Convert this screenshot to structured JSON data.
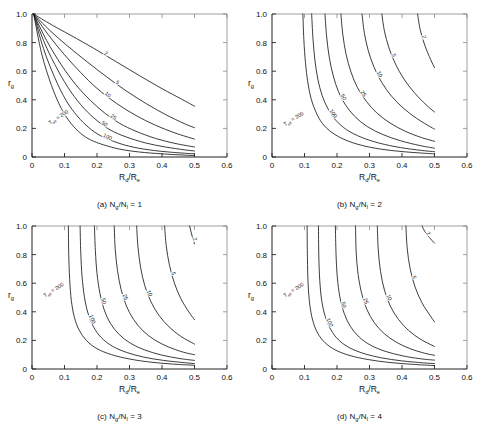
{
  "figure": {
    "panels": [
      {
        "id": "a",
        "caption_prefix": "(a)",
        "caption_num": "N",
        "caption_sub1": "g",
        "caption_slash": "/N",
        "caption_sub2": "l",
        "caption_eq": " = 1",
        "caption_full": "(a) Ng/Nl = 1"
      },
      {
        "id": "b",
        "caption_prefix": "(b)",
        "caption_num": "N",
        "caption_sub1": "g",
        "caption_slash": "/N",
        "caption_sub2": "l",
        "caption_eq": " = 2",
        "caption_full": "(b) Ng/Nl = 2"
      },
      {
        "id": "c",
        "caption_prefix": "(c)",
        "caption_num": "N",
        "caption_sub1": "g",
        "caption_slash": "/N",
        "caption_sub2": "l",
        "caption_eq": " = 3",
        "caption_full": "(c) Ng/Nl = 3"
      },
      {
        "id": "d",
        "caption_prefix": "(d)",
        "caption_num": "N",
        "caption_sub1": "g",
        "caption_slash": "/N",
        "caption_sub2": "l",
        "caption_eq": " = 4",
        "caption_full": "(d) Ng/Nl = 4"
      }
    ],
    "axis": {
      "x_title_main": "R",
      "x_title_sub1": "d",
      "x_title_mid": "/R",
      "x_title_sub2": "e",
      "x_title_full": "Rd/Re",
      "y_title_main": "r",
      "y_title_sub": "g",
      "y_title_full": "rg",
      "x_ticks": [
        "0",
        "0.1",
        "0.2",
        "0.3",
        "0.4",
        "0.5",
        "0.6"
      ],
      "y_ticks": [
        "0",
        "0.2",
        "0.4",
        "0.6",
        "0.8",
        "1.0"
      ]
    },
    "teff_label": {
      "main": "T",
      "sub": "eff",
      "eq": " = 200",
      "full": "Teff = 200"
    },
    "curve_labels": [
      "200",
      "100",
      "50",
      "25",
      "10",
      "5",
      "2"
    ]
  },
  "chart_data": {
    "type": "line",
    "title": "",
    "xlabel": "Rd/Re",
    "ylabel": "rg",
    "xlim": [
      0,
      0.6
    ],
    "ylim": [
      0,
      1.0
    ],
    "xticks": [
      0,
      0.1,
      0.2,
      0.3,
      0.4,
      0.5,
      0.6
    ],
    "yticks": [
      0,
      0.2,
      0.4,
      0.6,
      0.8,
      1.0
    ],
    "grid": false,
    "legend": "inline-curve-labels",
    "panel_count": 4,
    "parameter_name": "Teff",
    "parameter_values": [
      200,
      100,
      50,
      25,
      10,
      5,
      2
    ],
    "panels": [
      {
        "id": "a",
        "label": "(a) Ng/Nl = 1",
        "series": [
          {
            "name": "200",
            "x": [
              0.005,
              0.03,
              0.06,
              0.09,
              0.12,
              0.15,
              0.18,
              0.22,
              0.27,
              0.33,
              0.4,
              0.47,
              0.5
            ],
            "y": [
              1.0,
              0.72,
              0.5,
              0.34,
              0.235,
              0.165,
              0.12,
              0.085,
              0.055,
              0.035,
              0.022,
              0.013,
              0.01
            ]
          },
          {
            "name": "100",
            "x": [
              0.005,
              0.035,
              0.07,
              0.105,
              0.14,
              0.175,
              0.21,
              0.25,
              0.3,
              0.36,
              0.43,
              0.5
            ],
            "y": [
              1.0,
              0.76,
              0.555,
              0.395,
              0.285,
              0.205,
              0.15,
              0.11,
              0.075,
              0.05,
              0.033,
              0.022
            ]
          },
          {
            "name": "50",
            "x": [
              0.005,
              0.04,
              0.08,
              0.12,
              0.16,
              0.2,
              0.24,
              0.29,
              0.35,
              0.41,
              0.47,
              0.5
            ],
            "y": [
              1.0,
              0.79,
              0.605,
              0.455,
              0.34,
              0.255,
              0.19,
              0.14,
              0.098,
              0.07,
              0.05,
              0.042
            ]
          },
          {
            "name": "25",
            "x": [
              0.005,
              0.045,
              0.09,
              0.135,
              0.18,
              0.225,
              0.27,
              0.32,
              0.38,
              0.44,
              0.5
            ],
            "y": [
              1.0,
              0.815,
              0.645,
              0.505,
              0.395,
              0.305,
              0.235,
              0.18,
              0.13,
              0.095,
              0.07
            ]
          },
          {
            "name": "10",
            "x": [
              0.005,
              0.05,
              0.1,
              0.15,
              0.2,
              0.26,
              0.32,
              0.38,
              0.44,
              0.5
            ],
            "y": [
              1.0,
              0.855,
              0.715,
              0.59,
              0.48,
              0.375,
              0.29,
              0.222,
              0.168,
              0.125
            ]
          },
          {
            "name": "5",
            "x": [
              0.005,
              0.055,
              0.11,
              0.17,
              0.23,
              0.29,
              0.35,
              0.41,
              0.47,
              0.5
            ],
            "y": [
              1.0,
              0.885,
              0.775,
              0.665,
              0.56,
              0.462,
              0.375,
              0.298,
              0.232,
              0.205
            ]
          },
          {
            "name": "2",
            "x": [
              0.005,
              0.06,
              0.12,
              0.19,
              0.26,
              0.33,
              0.4,
              0.46,
              0.5
            ],
            "y": [
              1.0,
              0.925,
              0.85,
              0.76,
              0.665,
              0.57,
              0.478,
              0.405,
              0.355
            ]
          }
        ]
      },
      {
        "id": "b",
        "label": "(b) Ng/Nl = 2",
        "series": [
          {
            "name": "200",
            "x": [
              0.095,
              0.098,
              0.103,
              0.11,
              0.12,
              0.135,
              0.155,
              0.185,
              0.225,
              0.275,
              0.335,
              0.4,
              0.47,
              0.5
            ],
            "y": [
              1.0,
              0.82,
              0.66,
              0.525,
              0.41,
              0.315,
              0.235,
              0.17,
              0.12,
              0.082,
              0.055,
              0.038,
              0.026,
              0.022
            ]
          },
          {
            "name": "100",
            "x": [
              0.122,
              0.126,
              0.132,
              0.141,
              0.154,
              0.172,
              0.196,
              0.23,
              0.275,
              0.33,
              0.395,
              0.46,
              0.5
            ],
            "y": [
              1.0,
              0.83,
              0.678,
              0.545,
              0.432,
              0.338,
              0.258,
              0.19,
              0.138,
              0.097,
              0.066,
              0.046,
              0.037
            ]
          },
          {
            "name": "50",
            "x": [
              0.163,
              0.168,
              0.176,
              0.188,
              0.204,
              0.226,
              0.255,
              0.293,
              0.34,
              0.395,
              0.455,
              0.5
            ],
            "y": [
              1.0,
              0.845,
              0.7,
              0.572,
              0.46,
              0.365,
              0.283,
              0.213,
              0.158,
              0.114,
              0.08,
              0.062
            ]
          },
          {
            "name": "25",
            "x": [
              0.212,
              0.218,
              0.228,
              0.243,
              0.263,
              0.29,
              0.323,
              0.363,
              0.41,
              0.46,
              0.5
            ],
            "y": [
              1.0,
              0.855,
              0.718,
              0.595,
              0.485,
              0.39,
              0.307,
              0.238,
              0.18,
              0.136,
              0.11
            ]
          },
          {
            "name": "10",
            "x": [
              0.277,
              0.284,
              0.296,
              0.314,
              0.338,
              0.368,
              0.404,
              0.445,
              0.488,
              0.5
            ],
            "y": [
              1.0,
              0.87,
              0.745,
              0.628,
              0.52,
              0.425,
              0.342,
              0.27,
              0.21,
              0.195
            ]
          },
          {
            "name": "5",
            "x": [
              0.338,
              0.346,
              0.36,
              0.38,
              0.406,
              0.438,
              0.474,
              0.5
            ],
            "y": [
              1.0,
              0.88,
              0.762,
              0.65,
              0.545,
              0.45,
              0.365,
              0.315
            ]
          },
          {
            "name": "2",
            "x": [
              0.448,
              0.456,
              0.47,
              0.488,
              0.5
            ],
            "y": [
              1.0,
              0.89,
              0.782,
              0.682,
              0.625
            ]
          }
        ]
      },
      {
        "id": "c",
        "label": "(c) Ng/Nl = 3",
        "series": [
          {
            "name": "200",
            "x": [
              0.112,
              0.113,
              0.116,
              0.121,
              0.13,
              0.145,
              0.168,
              0.2,
              0.245,
              0.3,
              0.365,
              0.435,
              0.5
            ],
            "y": [
              1.0,
              0.8,
              0.625,
              0.48,
              0.365,
              0.272,
              0.198,
              0.142,
              0.1,
              0.07,
              0.048,
              0.034,
              0.026
            ]
          },
          {
            "name": "100",
            "x": [
              0.148,
              0.15,
              0.154,
              0.161,
              0.172,
              0.189,
              0.213,
              0.247,
              0.291,
              0.344,
              0.405,
              0.47,
              0.5
            ],
            "y": [
              1.0,
              0.815,
              0.648,
              0.508,
              0.392,
              0.296,
              0.22,
              0.16,
              0.116,
              0.083,
              0.06,
              0.044,
              0.038
            ]
          },
          {
            "name": "50",
            "x": [
              0.192,
              0.195,
              0.2,
              0.209,
              0.222,
              0.241,
              0.268,
              0.303,
              0.347,
              0.398,
              0.452,
              0.5
            ],
            "y": [
              1.0,
              0.828,
              0.668,
              0.53,
              0.415,
              0.32,
              0.242,
              0.18,
              0.133,
              0.098,
              0.074,
              0.06
            ]
          },
          {
            "name": "25",
            "x": [
              0.253,
              0.256,
              0.263,
              0.274,
              0.29,
              0.312,
              0.341,
              0.377,
              0.419,
              0.465,
              0.5
            ],
            "y": [
              1.0,
              0.84,
              0.69,
              0.557,
              0.443,
              0.348,
              0.268,
              0.204,
              0.155,
              0.118,
              0.1
            ]
          },
          {
            "name": "10",
            "x": [
              0.322,
              0.326,
              0.334,
              0.347,
              0.366,
              0.391,
              0.422,
              0.458,
              0.497,
              0.5
            ],
            "y": [
              1.0,
              0.855,
              0.712,
              0.583,
              0.47,
              0.374,
              0.294,
              0.228,
              0.178,
              0.174
            ]
          },
          {
            "name": "5",
            "x": [
              0.408,
              0.413,
              0.423,
              0.438,
              0.458,
              0.483,
              0.5
            ],
            "y": [
              1.0,
              0.862,
              0.726,
              0.602,
              0.492,
              0.398,
              0.345
            ]
          },
          {
            "name": "2",
            "x": [
              0.485,
              0.492,
              0.5
            ],
            "y": [
              1.0,
              0.935,
              0.875
            ]
          }
        ]
      },
      {
        "id": "d",
        "label": "(d) Ng/Nl = 4",
        "series": [
          {
            "name": "200",
            "x": [
              0.108,
              0.109,
              0.111,
              0.116,
              0.125,
              0.14,
              0.163,
              0.196,
              0.24,
              0.296,
              0.36,
              0.43,
              0.5
            ],
            "y": [
              1.0,
              0.78,
              0.6,
              0.455,
              0.342,
              0.253,
              0.184,
              0.132,
              0.094,
              0.066,
              0.046,
              0.033,
              0.024
            ]
          },
          {
            "name": "100",
            "x": [
              0.143,
              0.144,
              0.147,
              0.153,
              0.164,
              0.181,
              0.205,
              0.239,
              0.283,
              0.337,
              0.399,
              0.465,
              0.5
            ],
            "y": [
              1.0,
              0.792,
              0.618,
              0.478,
              0.366,
              0.275,
              0.203,
              0.148,
              0.108,
              0.078,
              0.057,
              0.043,
              0.038
            ]
          },
          {
            "name": "50",
            "x": [
              0.195,
              0.197,
              0.201,
              0.209,
              0.222,
              0.241,
              0.268,
              0.303,
              0.348,
              0.4,
              0.455,
              0.5
            ],
            "y": [
              1.0,
              0.805,
              0.64,
              0.502,
              0.39,
              0.298,
              0.224,
              0.167,
              0.124,
              0.093,
              0.072,
              0.062
            ]
          },
          {
            "name": "25",
            "x": [
              0.257,
              0.259,
              0.265,
              0.276,
              0.292,
              0.315,
              0.345,
              0.382,
              0.424,
              0.47,
              0.5
            ],
            "y": [
              1.0,
              0.818,
              0.662,
              0.528,
              0.416,
              0.323,
              0.248,
              0.188,
              0.143,
              0.11,
              0.096
            ]
          },
          {
            "name": "10",
            "x": [
              0.324,
              0.327,
              0.334,
              0.346,
              0.364,
              0.389,
              0.42,
              0.457,
              0.496,
              0.5
            ],
            "y": [
              1.0,
              0.832,
              0.682,
              0.552,
              0.44,
              0.347,
              0.27,
              0.208,
              0.162,
              0.158
            ]
          },
          {
            "name": "5",
            "x": [
              0.412,
              0.416,
              0.425,
              0.44,
              0.461,
              0.487,
              0.5
            ],
            "y": [
              1.0,
              0.845,
              0.702,
              0.575,
              0.465,
              0.372,
              0.33
            ]
          },
          {
            "name": "2",
            "x": [
              0.462,
              0.47,
              0.484,
              0.5
            ],
            "y": [
              1.0,
              0.962,
              0.92,
              0.88
            ]
          }
        ]
      }
    ]
  }
}
